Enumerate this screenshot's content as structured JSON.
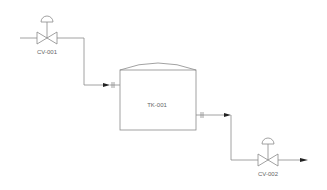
{
  "diagram": {
    "type": "P&ID",
    "colors": {
      "line": "#8a8a8a",
      "arrow": "#222222",
      "text": "#666666",
      "background": "#ffffff"
    },
    "equipment": [
      {
        "id": "cv001",
        "label": "CV-001",
        "type": "control-valve"
      },
      {
        "id": "tk001",
        "label": "TK-001",
        "type": "tank"
      },
      {
        "id": "cv002",
        "label": "CV-002",
        "type": "control-valve"
      }
    ],
    "connections": [
      {
        "from": "inlet",
        "to": "cv001"
      },
      {
        "from": "cv001",
        "to": "tk001"
      },
      {
        "from": "tk001",
        "to": "cv002"
      },
      {
        "from": "cv002",
        "to": "outlet"
      }
    ]
  }
}
